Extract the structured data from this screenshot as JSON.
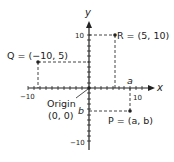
{
  "axes": {
    "x_label": "x",
    "y_label": "y",
    "x_min_tick": "−10",
    "x_max_tick": "10",
    "y_min_tick": "−10",
    "y_max_tick": "10"
  },
  "points": {
    "R": {
      "label": "R = (5, 10)"
    },
    "Q": {
      "label": "Q = (−10, 5)"
    },
    "P": {
      "label": "P = (a, b)",
      "a_label": "a",
      "b_label": "b"
    }
  },
  "origin": {
    "line1": "Origin",
    "line2": "(0, 0)"
  },
  "colors": {
    "ink": "#222222",
    "dash": "#444444"
  }
}
